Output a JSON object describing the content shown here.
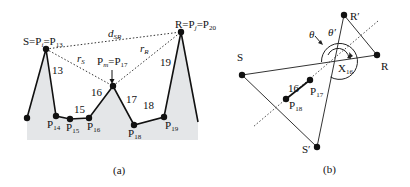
{
  "panel_a": {
    "caption": "(a)",
    "labels": {
      "S": "S=P",
      "S_sub_i": "i",
      "S_eq": "=P",
      "S_sub": "13",
      "R": "R=P",
      "R_sub_j": "j",
      "R_eq": "=P",
      "R_sub": "20",
      "d": "d",
      "d_sub": "SR",
      "rS": "r",
      "rS_sub": "S",
      "rR": "r",
      "rR_sub": "R",
      "Pm": "P",
      "Pm_sub_m": "m",
      "Pm_eq": "=P",
      "Pm_sub": "17",
      "P14": "P",
      "P14_sub": "14",
      "P15": "P",
      "P15_sub": "15",
      "P16": "P",
      "P16_sub": "16",
      "P18": "P",
      "P18_sub": "18",
      "P19": "P",
      "P19_sub": "19",
      "seg13": "13",
      "seg15": "15",
      "seg16": "16",
      "seg17": "17",
      "seg18": "18",
      "seg19": "19"
    }
  },
  "panel_b": {
    "caption": "(b)",
    "labels": {
      "S": "S",
      "R": "R",
      "Rp": "R′",
      "Sp": "S′",
      "X": "X",
      "X_sub": "16",
      "theta": "θ",
      "theta_p": "θ′",
      "P17": "P",
      "P17_sub": "17",
      "P18": "P",
      "P18_sub": "18",
      "seg16": "16"
    }
  },
  "colors": {
    "fill": "#e4e6e8",
    "line": "#111111"
  }
}
